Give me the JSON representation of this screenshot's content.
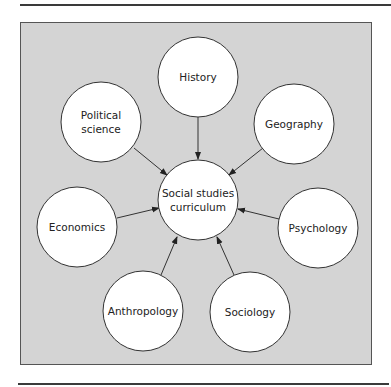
{
  "diagram": {
    "type": "hub-and-spoke concept map",
    "center": {
      "id": "center",
      "label_lines": [
        "Social studies",
        "curriculum"
      ],
      "cx": 198,
      "cy": 200
    },
    "nodes": [
      {
        "id": "history",
        "label_lines": [
          "History"
        ],
        "cx": 198,
        "cy": 77
      },
      {
        "id": "geography",
        "label_lines": [
          "Geography"
        ],
        "cx": 294,
        "cy": 124
      },
      {
        "id": "psychology",
        "label_lines": [
          "Psychology"
        ],
        "cx": 318,
        "cy": 228
      },
      {
        "id": "sociology",
        "label_lines": [
          "Sociology"
        ],
        "cx": 250,
        "cy": 312
      },
      {
        "id": "anthropology",
        "label_lines": [
          "Anthropology"
        ],
        "cx": 143,
        "cy": 311
      },
      {
        "id": "economics",
        "label_lines": [
          "Economics"
        ],
        "cx": 77,
        "cy": 227
      },
      {
        "id": "political-science",
        "label_lines": [
          "Political",
          "science"
        ],
        "cx": 101,
        "cy": 122
      }
    ],
    "edges": [
      {
        "from": "history",
        "to": "center"
      },
      {
        "from": "geography",
        "to": "center"
      },
      {
        "from": "psychology",
        "to": "center"
      },
      {
        "from": "sociology",
        "to": "center"
      },
      {
        "from": "anthropology",
        "to": "center"
      },
      {
        "from": "economics",
        "to": "center"
      },
      {
        "from": "political-science",
        "to": "center"
      }
    ],
    "radius": 40,
    "colors": {
      "panel": "#d4d4d4",
      "node_fill": "#ffffff",
      "stroke": "#333333"
    }
  },
  "labels": {
    "center_line1": "Social studies",
    "center_line2": "curriculum",
    "history": "History",
    "geography": "Geography",
    "psychology": "Psychology",
    "sociology": "Sociology",
    "anthropology": "Anthropology",
    "economics": "Economics",
    "political_line1": "Political",
    "political_line2": "science"
  }
}
